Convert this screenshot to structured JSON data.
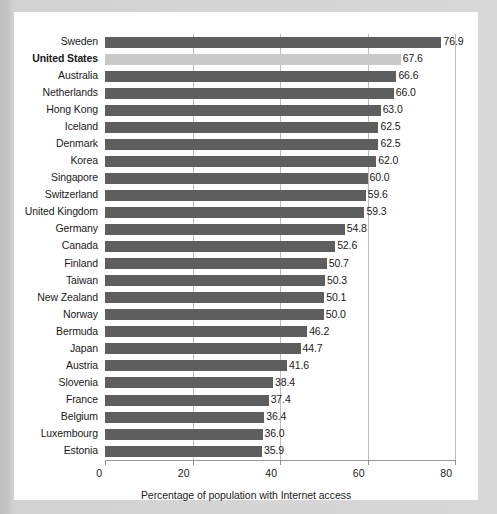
{
  "chart_data": {
    "type": "bar",
    "orientation": "horizontal",
    "title": "",
    "xlabel": "Percentage of population with Internet access",
    "ylabel": "",
    "xlim": [
      0,
      80
    ],
    "xticks": [
      0,
      20,
      40,
      60,
      80
    ],
    "xtick_labels": [
      "0",
      "20",
      "40",
      "60",
      "80"
    ],
    "grid": "vertical",
    "legend": "none",
    "categories": [
      "Sweden",
      "United States",
      "Australia",
      "Netherlands",
      "Hong Kong",
      "Iceland",
      "Denmark",
      "Korea",
      "Singapore",
      "Switzerland",
      "United Kingdom",
      "Germany",
      "Canada",
      "Finland",
      "Taiwan",
      "New Zealand",
      "Norway",
      "Bermuda",
      "Japan",
      "Austria",
      "Slovenia",
      "France",
      "Belgium",
      "Luxembourg",
      "Estonia"
    ],
    "values": [
      76.9,
      67.6,
      66.6,
      66.0,
      63.0,
      62.5,
      62.5,
      62.0,
      60.0,
      59.6,
      59.3,
      54.8,
      52.6,
      50.7,
      50.3,
      50.1,
      50.0,
      46.2,
      44.7,
      41.6,
      38.4,
      37.4,
      36.4,
      36.0,
      35.9
    ],
    "value_labels": [
      "76.9",
      "67.6",
      "66.6",
      "66.0",
      "63.0",
      "62.5",
      "62.5",
      "62.0",
      "60.0",
      "59.6",
      "59.3",
      "54.8",
      "52.6",
      "50.7",
      "50.3",
      "50.1",
      "50.0",
      "46.2",
      "44.7",
      "41.6",
      "38.4",
      "37.4",
      "36.4",
      "36.0",
      "35.9"
    ],
    "highlighted_category": "United States",
    "colors": {
      "bar": "#5e5e5e",
      "bar_highlight": "#c9c9c9",
      "gridline": "#bdbdbd",
      "axis": "#9a9a9a",
      "text": "#1a1a1a",
      "panel_background": "#ffffff",
      "figure_background": "#d2d2d2"
    }
  }
}
